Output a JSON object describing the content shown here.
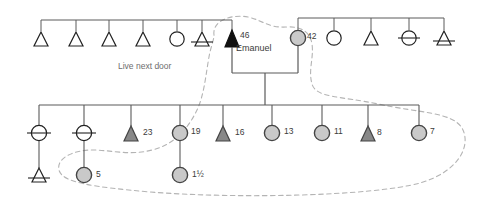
{
  "diagram": {
    "colors": {
      "line": "#5a5a5a",
      "symbol_stroke": "#222222",
      "fill_none": "#ffffff",
      "fill_gray": "#c9c9c9",
      "fill_dark_gray": "#888888",
      "fill_black": "#111111",
      "boundary_dashed": "#b4b4b4",
      "text": "#3b3b3b",
      "note_text": "#6d6d6d"
    },
    "annotations": [
      {
        "id": "note-live-next-door",
        "text": "Live next door",
        "x": 118,
        "y": 66
      }
    ],
    "proband": {
      "name": "Emanuel",
      "age": "46",
      "sex": "male",
      "fill": "black"
    },
    "spouse": {
      "age": "42",
      "sex": "female",
      "fill": "gray"
    },
    "generations": [
      {
        "id": "generation-1",
        "label": "Parental sibship row",
        "members": [
          {
            "id": "g1-p1",
            "sex": "male",
            "fill": "none",
            "deceased": false,
            "age": "",
            "cx": 41,
            "cy": 40
          },
          {
            "id": "g1-p2",
            "sex": "male",
            "fill": "none",
            "deceased": false,
            "age": "",
            "cx": 76,
            "cy": 40
          },
          {
            "id": "g1-p3",
            "sex": "male",
            "fill": "none",
            "deceased": false,
            "age": "",
            "cx": 109,
            "cy": 40
          },
          {
            "id": "g1-p4",
            "sex": "male",
            "fill": "none",
            "deceased": false,
            "age": "",
            "cx": 143,
            "cy": 40
          },
          {
            "id": "g1-p5",
            "sex": "female",
            "fill": "none",
            "deceased": false,
            "age": "",
            "cx": 177,
            "cy": 40
          },
          {
            "id": "g1-p6",
            "sex": "male",
            "fill": "none",
            "deceased": true,
            "age": "",
            "cx": 202,
            "cy": 40
          },
          {
            "id": "g1-p7",
            "sex": "male",
            "fill": "black",
            "deceased": false,
            "age": "46",
            "cx": 232,
            "cy": 40,
            "name": "Emanuel"
          },
          {
            "id": "g1-p8",
            "sex": "female",
            "fill": "gray",
            "deceased": false,
            "age": "42",
            "cx": 298,
            "cy": 38
          },
          {
            "id": "g1-p9",
            "sex": "female",
            "fill": "none",
            "deceased": false,
            "age": "",
            "cx": 334,
            "cy": 38
          },
          {
            "id": "g1-p10",
            "sex": "male",
            "fill": "none",
            "deceased": false,
            "age": "",
            "cx": 371,
            "cy": 38
          },
          {
            "id": "g1-p11",
            "sex": "female",
            "fill": "none",
            "deceased": true,
            "age": "",
            "cx": 409,
            "cy": 38
          },
          {
            "id": "g1-p12",
            "sex": "male",
            "fill": "none",
            "deceased": true,
            "age": "",
            "cx": 444,
            "cy": 38
          }
        ]
      },
      {
        "id": "generation-2",
        "label": "Children sibship row",
        "members": [
          {
            "id": "g2-c1",
            "sex": "female",
            "fill": "none",
            "deceased": true,
            "age": "",
            "cx": 39,
            "cy": 133
          },
          {
            "id": "g2-c2",
            "sex": "female",
            "fill": "none",
            "deceased": true,
            "age": "",
            "cx": 84,
            "cy": 133
          },
          {
            "id": "g2-c3",
            "sex": "male",
            "fill": "dark",
            "deceased": false,
            "age": "23",
            "cx": 131,
            "cy": 133
          },
          {
            "id": "g2-c4",
            "sex": "female",
            "fill": "gray",
            "deceased": false,
            "age": "19",
            "cx": 180,
            "cy": 133
          },
          {
            "id": "g2-c5",
            "sex": "male",
            "fill": "dark",
            "deceased": false,
            "age": "16",
            "cx": 223,
            "cy": 133
          },
          {
            "id": "g2-c6",
            "sex": "female",
            "fill": "gray",
            "deceased": false,
            "age": "13",
            "cx": 272,
            "cy": 133
          },
          {
            "id": "g2-c7",
            "sex": "female",
            "fill": "gray",
            "deceased": false,
            "age": "11",
            "cx": 322,
            "cy": 133
          },
          {
            "id": "g2-c8",
            "sex": "male",
            "fill": "dark",
            "deceased": false,
            "age": "8",
            "cx": 368,
            "cy": 133
          },
          {
            "id": "g2-c9",
            "sex": "female",
            "fill": "gray",
            "deceased": false,
            "age": "7",
            "cx": 419,
            "cy": 133
          }
        ]
      },
      {
        "id": "generation-3",
        "label": "Grandchildren row",
        "members": [
          {
            "id": "g3-d1",
            "sex": "male",
            "fill": "none",
            "deceased": true,
            "age": "",
            "cx": 39,
            "cy": 175
          },
          {
            "id": "g3-d2",
            "sex": "female",
            "fill": "gray",
            "deceased": false,
            "age": "5",
            "cx": 84,
            "cy": 175
          },
          {
            "id": "g3-d3",
            "sex": "female",
            "fill": "gray",
            "deceased": false,
            "age": "1½",
            "cx": 180,
            "cy": 175
          }
        ]
      }
    ],
    "legend_names": {
      "male_symbol": "triangle-symbol",
      "female_symbol": "circle-symbol",
      "deceased_marker": "strike-through-line",
      "household_boundary": "dashed-boundary-curve"
    }
  }
}
